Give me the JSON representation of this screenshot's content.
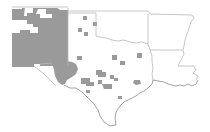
{
  "map": {
    "region": "South-central United States",
    "states_shown": [
      "New Mexico",
      "Texas",
      "Oklahoma",
      "Arkansas",
      "Louisiana"
    ],
    "colors": {
      "background": "#ffffff",
      "shaded_fill": "#9a9a9a",
      "state_border": "#b8b8b8",
      "coastline": "#8a8a8a"
    },
    "legend": null,
    "title": null
  }
}
